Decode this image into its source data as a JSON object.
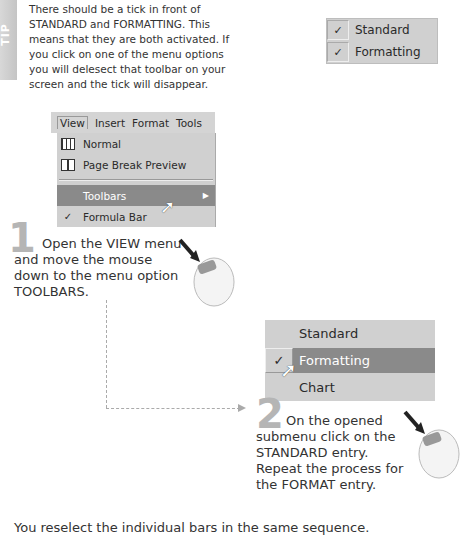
{
  "tip": {
    "label": "TIP",
    "text": "There should be a tick in front of STANDARD and FORMATTING. This means that they are both activated. If you click on one of the menu options you will delesect that toolbar on your screen and the tick will disappear."
  },
  "mini_menu": {
    "items": [
      {
        "check": "✓",
        "label": "Standard"
      },
      {
        "check": "✓",
        "label": "Formatting"
      }
    ]
  },
  "menubar": {
    "items": [
      "View",
      "Insert",
      "Format",
      "Tools"
    ]
  },
  "view_menu": {
    "items": [
      {
        "icon": "grid-icon",
        "label": "Normal"
      },
      {
        "icon": "page-break-icon",
        "label": "Page Break Preview"
      },
      {
        "label": "Toolbars",
        "submenu_arrow": "▶",
        "highlighted": true
      },
      {
        "check": "✓",
        "label": "Formula Bar"
      }
    ]
  },
  "step1": {
    "number": "1",
    "text": "Open the VIEW menu and move the mouse down to the menu option TOOLBARS."
  },
  "submenu": {
    "items": [
      {
        "label": "Standard"
      },
      {
        "check": "✓",
        "label": "Formatting",
        "highlighted": true
      },
      {
        "label": "Chart"
      }
    ]
  },
  "step2": {
    "number": "2",
    "text": "On the opened submenu click on the STANDARD entry. Repeat the process for the FORMAT entry."
  },
  "footer": {
    "text": "You reselect the individual bars in the same sequence."
  }
}
